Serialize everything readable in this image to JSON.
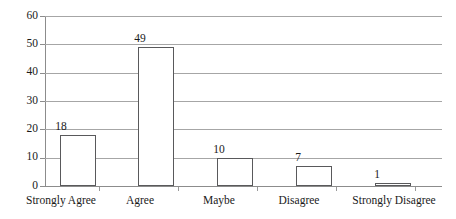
{
  "chart_data": {
    "type": "bar",
    "title": "",
    "subtitle": "",
    "xlabel": "",
    "ylabel": "",
    "categories": [
      "Strongly Agree",
      "Agree",
      "Maybe",
      "Disagree",
      "Strongly Disagree"
    ],
    "values": [
      18,
      49,
      10,
      7,
      1
    ],
    "data_labels": [
      "18",
      "49",
      "10",
      "7",
      "1"
    ],
    "ylim": [
      0,
      60
    ],
    "ytick_step": 10,
    "ytick_labels": [
      "60",
      "50",
      "40",
      "30",
      "20",
      "10",
      "0"
    ],
    "ytick_values": [
      60,
      50,
      40,
      30,
      20,
      10,
      0
    ],
    "grid": "horizontal",
    "legend": "none",
    "colors": {
      "bar_fill": "#ffffff",
      "bar_border": "#59595b",
      "gridline": "#a6a6a6",
      "axis": "#8c8c8c",
      "text": "#1a1a1a",
      "background": "#ffffff"
    }
  }
}
